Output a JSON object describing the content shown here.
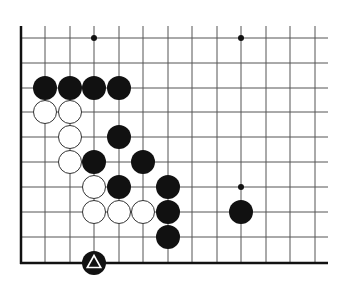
{
  "diagram": {
    "type": "go-board-fragment",
    "background": "#ffffff",
    "line_color": "#555555",
    "edge_color": "#111111",
    "grid": {
      "columns_x": [
        21,
        45,
        70,
        94,
        119,
        143,
        168,
        192,
        217,
        241,
        266,
        290,
        315
      ],
      "rows_y": [
        38,
        63,
        88,
        112,
        137,
        162,
        187,
        212,
        237,
        263
      ],
      "top_y": 26,
      "right_x": 328,
      "left_edge": true,
      "bottom_edge": true
    },
    "star_points": [
      {
        "col": 3,
        "row": 0
      },
      {
        "col": 9,
        "row": 0
      },
      {
        "col": 9,
        "row": 6
      }
    ],
    "stones": [
      {
        "color": "black",
        "col": 1,
        "row": 2
      },
      {
        "color": "black",
        "col": 2,
        "row": 2
      },
      {
        "color": "black",
        "col": 3,
        "row": 2
      },
      {
        "color": "black",
        "col": 4,
        "row": 2
      },
      {
        "color": "white",
        "col": 1,
        "row": 3
      },
      {
        "color": "white",
        "col": 2,
        "row": 3
      },
      {
        "color": "white",
        "col": 2,
        "row": 4
      },
      {
        "color": "black",
        "col": 4,
        "row": 4
      },
      {
        "color": "white",
        "col": 2,
        "row": 5
      },
      {
        "color": "black",
        "col": 3,
        "row": 5
      },
      {
        "color": "black",
        "col": 5,
        "row": 5
      },
      {
        "color": "white",
        "col": 3,
        "row": 6
      },
      {
        "color": "black",
        "col": 4,
        "row": 6
      },
      {
        "color": "black",
        "col": 6,
        "row": 6
      },
      {
        "color": "white",
        "col": 3,
        "row": 7
      },
      {
        "color": "white",
        "col": 4,
        "row": 7
      },
      {
        "color": "white",
        "col": 5,
        "row": 7
      },
      {
        "color": "black",
        "col": 6,
        "row": 7
      },
      {
        "color": "black",
        "col": 9,
        "row": 7
      },
      {
        "color": "black",
        "col": 6,
        "row": 8
      },
      {
        "color": "black",
        "col": 3,
        "row": 9,
        "marker": "triangle"
      }
    ],
    "stone_radius": 12
  }
}
